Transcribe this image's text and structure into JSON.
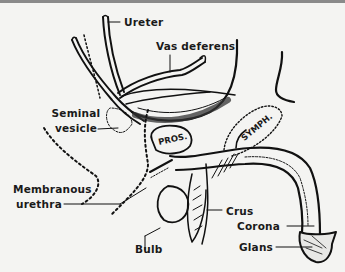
{
  "figure": {
    "type": "anatomical-line-drawing",
    "line_color": "#111111",
    "background_color": "#f4f4f2",
    "labels": {
      "ureter": "Ureter",
      "vas_deferens": "Vas deferens",
      "seminal_vesicle_line1": "Seminal",
      "seminal_vesicle_line2": "vesicle",
      "membranous_urethra_line1": "Membranous",
      "membranous_urethra_line2": "urethra",
      "bulb": "Bulb",
      "crus": "Crus",
      "corona": "Corona",
      "glans": "Glans"
    },
    "organ_labels": {
      "prostate": "PROS.",
      "symphysis": "SYMPH."
    }
  }
}
